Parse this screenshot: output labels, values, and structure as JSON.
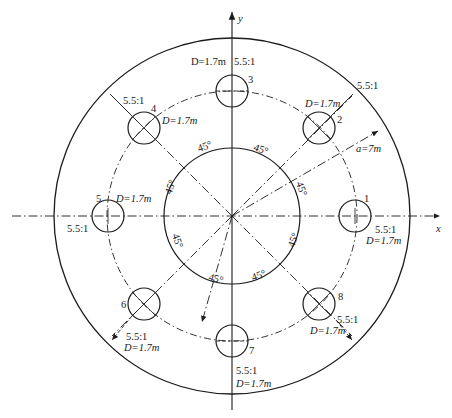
{
  "diagram": {
    "type": "circular blast-hole layout",
    "axes": {
      "x_label": "x",
      "y_label": "y"
    },
    "center": [
      232,
      216
    ],
    "outer_circle_radius_px": 178,
    "inner_circle_radius_px": 68,
    "hole_ring_radius_px": 125,
    "hole_radius_px": 16,
    "radius_label": "a=7m",
    "angle_labels": [
      "45°",
      "45°",
      "45°",
      "45°",
      "45°",
      "45°",
      "45°",
      "45°"
    ],
    "holes": [
      {
        "id": "1",
        "angle_deg": 0,
        "ratio": "5.5:1",
        "diameter": "D=1.7m"
      },
      {
        "id": "2",
        "angle_deg": 45,
        "ratio": "5.5:1",
        "diameter": "D=1.7m"
      },
      {
        "id": "3",
        "angle_deg": 90,
        "ratio": "5.5:1",
        "diameter": "D=1.7m"
      },
      {
        "id": "4",
        "angle_deg": 135,
        "ratio": "5.5:1",
        "diameter": "D=1.7m"
      },
      {
        "id": "5",
        "angle_deg": 180,
        "ratio": "5.5:1",
        "diameter": "D=1.7m"
      },
      {
        "id": "6",
        "angle_deg": 225,
        "ratio": "5.5:1",
        "diameter": "D=1.7m"
      },
      {
        "id": "7",
        "angle_deg": 270,
        "ratio": "5.5:1",
        "diameter": "D=1.7m"
      },
      {
        "id": "8",
        "angle_deg": 315,
        "ratio": "5.5:1",
        "diameter": "D=1.7m"
      }
    ]
  }
}
